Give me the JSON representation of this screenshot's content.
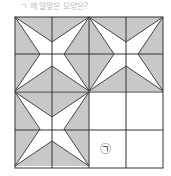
{
  "caption": "ㄱ 에 알맞은 모양은?",
  "grid": {
    "rows": 4,
    "cols": 4,
    "line_color": "#333333",
    "shade_color": "#c8c8c8",
    "filled_blocks": [
      "top-left",
      "top-right",
      "bottom-left"
    ],
    "empty_block": "bottom-right"
  },
  "blank_label": "㉠"
}
